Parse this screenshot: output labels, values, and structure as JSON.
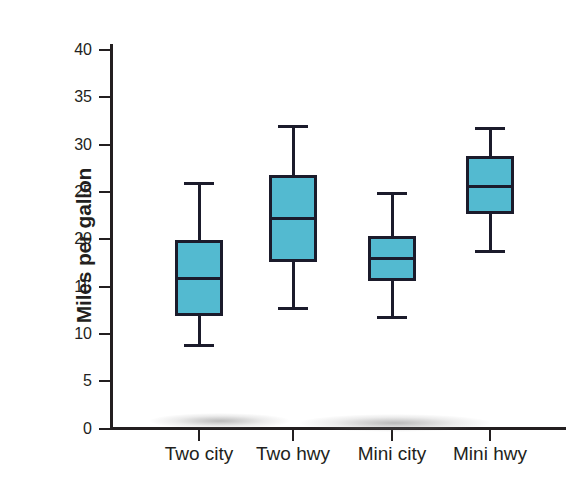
{
  "chart_data": {
    "type": "box",
    "title": "",
    "xlabel": "",
    "ylabel": "Miles per gallon",
    "ylim": [
      0,
      42
    ],
    "yticks": [
      0,
      5,
      10,
      15,
      20,
      25,
      30,
      35,
      40
    ],
    "ytick_labels": [
      "0",
      "5",
      "10",
      "15",
      "20",
      "25",
      "30",
      "35",
      "40"
    ],
    "grid": false,
    "legend": "none",
    "categories": [
      "Two city",
      "Two hwy",
      "Mini city",
      "Mini hwy"
    ],
    "boxes": [
      {
        "label": "Two city",
        "min": 8.8,
        "q1": 11.9,
        "median": 15.8,
        "q3": 19.9,
        "max": 25.9
      },
      {
        "label": "Two hwy",
        "min": 12.7,
        "q1": 17.6,
        "median": 22.2,
        "q3": 26.8,
        "max": 31.9
      },
      {
        "label": "Mini city",
        "min": 11.7,
        "q1": 15.6,
        "median": 18.0,
        "q3": 20.3,
        "max": 24.8
      },
      {
        "label": "Mini hwy",
        "min": 18.7,
        "q1": 22.7,
        "median": 25.6,
        "q3": 28.8,
        "max": 31.7
      }
    ],
    "colors": {
      "box_fill": "#53bad0",
      "box_edge": "#1b1b2b",
      "axis": "#231f20",
      "background": "#ffffff"
    }
  }
}
